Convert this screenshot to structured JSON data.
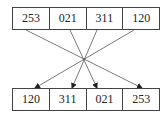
{
  "top_row": {
    "values": [
      "253",
      "021",
      "311",
      "120"
    ]
  },
  "bottom_row": {
    "values": [
      "120",
      "311",
      "021",
      "253"
    ]
  },
  "connections": [
    {
      "from": "253",
      "to": "253"
    },
    {
      "from": "021",
      "to": "021"
    },
    {
      "from": "311",
      "to": "311"
    },
    {
      "from": "120",
      "to": "120"
    }
  ]
}
